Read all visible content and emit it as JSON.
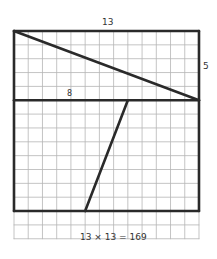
{
  "diagram": {
    "grid": {
      "columns": 13,
      "rows_total": 15,
      "rows_bold_region": 13,
      "origin_px": [
        14,
        31
      ],
      "cell_w_px": 14.23,
      "cell_h_px": 13.85,
      "grid_color": "#b5b5b5",
      "line_color": "#2a2a2a"
    },
    "labels": {
      "top_width": "13",
      "right_height": "5",
      "middle_segment": "8",
      "equation": "13 × 13 = 169"
    },
    "shapes": {
      "outer_square": {
        "cols": 13,
        "rows": 13
      },
      "top_strip": {
        "cols": 13,
        "rows": 5
      },
      "diagonal": {
        "from_cell": [
          0,
          0
        ],
        "to_cell": [
          13,
          5
        ]
      },
      "divider_line": {
        "row": 5
      },
      "slant_cut": {
        "from_cell": [
          8,
          5
        ],
        "to_cell": [
          5,
          13
        ]
      }
    }
  }
}
